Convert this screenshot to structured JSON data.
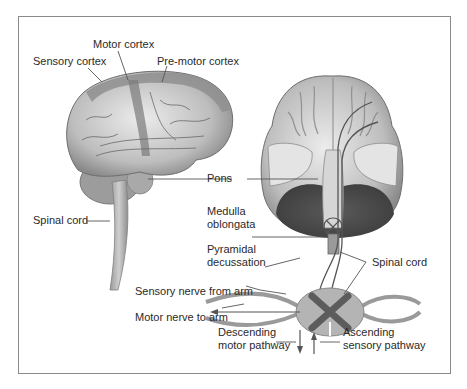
{
  "figure": {
    "labels": {
      "motor_cortex": "Motor cortex",
      "sensory_cortex": "Sensory cortex",
      "premotor_cortex": "Pre-motor cortex",
      "pons": "Pons",
      "spinal_cord_left": "Spinal cord",
      "medulla_line1": "Medulla",
      "medulla_line2": "oblongata",
      "pyramidal_line1": "Pyramidal",
      "pyramidal_line2": "decussation",
      "spinal_cord_right": "Spinal cord",
      "sensory_nerve": "Sensory nerve from arm",
      "motor_nerve": "Motor nerve to arm",
      "descending_line1": "Descending",
      "descending_line2": "motor pathway",
      "ascending_line1": "Ascending",
      "ascending_line2": "sensory pathway"
    },
    "colors": {
      "frame": "#8a8a8a",
      "brain_light": "#d8d8d8",
      "brain_mid": "#a8a8a8",
      "brain_dark": "#5a5a5a",
      "leader_line": "#555555",
      "text": "#2a2a2a"
    }
  }
}
